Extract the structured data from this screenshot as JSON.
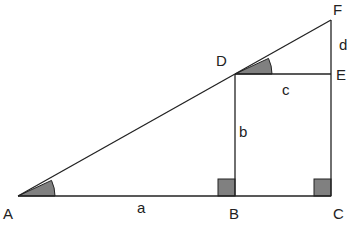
{
  "diagram": {
    "colors": {
      "line": "#222222",
      "fill": "#808080",
      "background": "#ffffff"
    },
    "points": {
      "A": {
        "label": "A",
        "x": 18,
        "y": 196
      },
      "B": {
        "label": "B",
        "x": 235,
        "y": 196
      },
      "C": {
        "label": "C",
        "x": 331,
        "y": 196
      },
      "D": {
        "label": "D",
        "x": 235,
        "y": 74
      },
      "E": {
        "label": "E",
        "x": 331,
        "y": 74
      },
      "F": {
        "label": "F",
        "x": 331,
        "y": 20
      }
    },
    "segment_labels": {
      "a": "a",
      "b": "b",
      "c": "c",
      "d": "d"
    }
  }
}
